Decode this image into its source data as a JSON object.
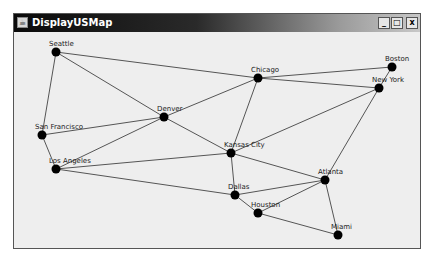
{
  "window": {
    "title": "DisplayUSMap",
    "icon": "java-cup-icon",
    "controls": {
      "minimize": "_",
      "maximize": "□",
      "close": "x"
    }
  },
  "graph": {
    "node_color": "#000000",
    "edge_color": "#555555",
    "nodes": [
      {
        "name": "Seattle",
        "x": 56,
        "y": 52
      },
      {
        "name": "San Francisco",
        "x": 42,
        "y": 135
      },
      {
        "name": "Los Angeles",
        "x": 56,
        "y": 169
      },
      {
        "name": "Denver",
        "x": 164,
        "y": 117
      },
      {
        "name": "Kansas City",
        "x": 231,
        "y": 153
      },
      {
        "name": "Chicago",
        "x": 258,
        "y": 78
      },
      {
        "name": "Boston",
        "x": 392,
        "y": 67
      },
      {
        "name": "New York",
        "x": 379,
        "y": 88
      },
      {
        "name": "Atlanta",
        "x": 325,
        "y": 180
      },
      {
        "name": "Miami",
        "x": 338,
        "y": 235
      },
      {
        "name": "Dallas",
        "x": 235,
        "y": 195
      },
      {
        "name": "Houston",
        "x": 258,
        "y": 213
      }
    ],
    "edges": [
      [
        "Seattle",
        "San Francisco"
      ],
      [
        "Seattle",
        "Denver"
      ],
      [
        "Seattle",
        "Chicago"
      ],
      [
        "San Francisco",
        "Los Angeles"
      ],
      [
        "San Francisco",
        "Denver"
      ],
      [
        "Los Angeles",
        "Denver"
      ],
      [
        "Los Angeles",
        "Kansas City"
      ],
      [
        "Los Angeles",
        "Dallas"
      ],
      [
        "Denver",
        "Chicago"
      ],
      [
        "Denver",
        "Kansas City"
      ],
      [
        "Kansas City",
        "Chicago"
      ],
      [
        "Kansas City",
        "New York"
      ],
      [
        "Kansas City",
        "Atlanta"
      ],
      [
        "Kansas City",
        "Dallas"
      ],
      [
        "Chicago",
        "Boston"
      ],
      [
        "Chicago",
        "New York"
      ],
      [
        "Boston",
        "New York"
      ],
      [
        "New York",
        "Atlanta"
      ],
      [
        "Atlanta",
        "Miami"
      ],
      [
        "Atlanta",
        "Dallas"
      ],
      [
        "Atlanta",
        "Houston"
      ],
      [
        "Dallas",
        "Houston"
      ],
      [
        "Houston",
        "Miami"
      ]
    ]
  }
}
